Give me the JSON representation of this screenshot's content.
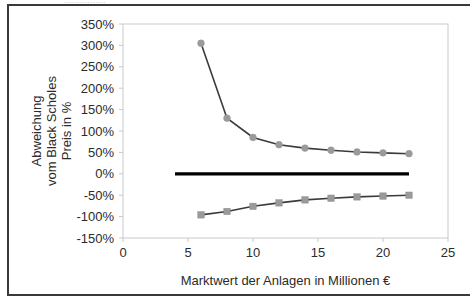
{
  "figure": {
    "clipped_header_text": "................",
    "border_color": "#3a3a3a"
  },
  "chart_data": {
    "type": "line",
    "title": "",
    "xlabel": "Marktwert der Anlagen in Millionen €",
    "ylabel": "Abweichung vom Black Scholes Preis in %",
    "ylabel_line1": "Abweichung",
    "ylabel_line2": "vom Black Scholes",
    "ylabel_line3": "Preis in %",
    "x": [
      6,
      8,
      10,
      12,
      14,
      16,
      18,
      20,
      22
    ],
    "xlim": [
      0,
      25
    ],
    "ylim": [
      -150,
      350
    ],
    "xticks": [
      0,
      5,
      10,
      15,
      20,
      25
    ],
    "xtick_labels": [
      "0",
      "5",
      "10",
      "15",
      "20",
      "25"
    ],
    "yticks": [
      -150,
      -100,
      -50,
      0,
      50,
      100,
      150,
      200,
      250,
      300,
      350
    ],
    "ytick_labels": [
      "-150%",
      "-100%",
      "-50%",
      "0%",
      "50%",
      "100%",
      "150%",
      "200%",
      "250%",
      "300%",
      "350%"
    ],
    "grid": false,
    "legend": "none",
    "series": [
      {
        "name": "obere Abweichung",
        "marker": "circle",
        "color": "#9a9a9a",
        "line_color": "#3b3b3b",
        "values": [
          305,
          130,
          85,
          68,
          60,
          55,
          51,
          49,
          47
        ]
      },
      {
        "name": "untere Abweichung",
        "marker": "square",
        "color": "#9a9a9a",
        "line_color": "#3b3b3b",
        "values": [
          -96,
          -88,
          -76,
          -68,
          -61,
          -57,
          -54,
          -52,
          -50
        ]
      },
      {
        "name": "Nulllinie",
        "marker": "none",
        "color": "#000000",
        "line_color": "#000000",
        "x": [
          4,
          22
        ],
        "values": [
          0,
          0
        ]
      }
    ]
  }
}
